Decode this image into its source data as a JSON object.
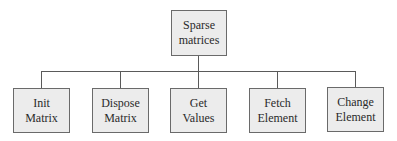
{
  "root": {
    "label": "Sparse\nmatrices"
  },
  "children": [
    {
      "label": "Init\nMatrix"
    },
    {
      "label": "Dispose\nMatrix"
    },
    {
      "label": "Get\nValues"
    },
    {
      "label": "Fetch\nElement"
    },
    {
      "label": "Change\nElement"
    }
  ],
  "colors": {
    "box_fill": "#ececec",
    "box_border": "#6a6a6a",
    "line": "#5a5a5a"
  }
}
